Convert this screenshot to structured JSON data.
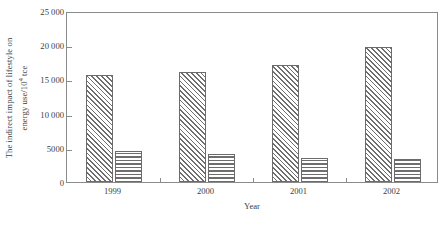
{
  "chart_data": {
    "type": "bar",
    "title": "",
    "subtitle": "",
    "xlabel": "Year",
    "ylabel": "The indirect impact of lifestyle on energy use/10⁴ tce",
    "ylabel_line1": "The indirect impact of lifestyle on",
    "ylabel_line2_pre": "energy use/10",
    "ylabel_line2_sup": "4",
    "ylabel_line2_post": " tce",
    "categories": [
      "1999",
      "2000",
      "2001",
      "2002"
    ],
    "series": [
      {
        "name": "diagonal-hatched",
        "pattern": "diagonal-hatch",
        "values": [
          15600,
          16100,
          17100,
          19700
        ]
      },
      {
        "name": "horizontal-hatched",
        "pattern": "horizontal-hatch",
        "values": [
          4600,
          4100,
          3500,
          3300
        ]
      }
    ],
    "ylim": [
      0,
      25000
    ],
    "yticks": [
      0,
      5000,
      10000,
      15000,
      20000,
      25000
    ],
    "ytick_labels": [
      "0",
      "5000",
      "10 000",
      "15 000",
      "20 000",
      "25 000"
    ],
    "grid": false,
    "legend": "none",
    "frame": true,
    "colors": {
      "axis": "#8a8a8a",
      "bar_edge": "#6b6b6b",
      "hatch": "#6e6e6e",
      "background": "#ffffff",
      "text": "#3d3d3d"
    }
  }
}
